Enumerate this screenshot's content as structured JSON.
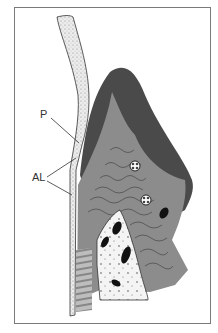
{
  "figure": {
    "labels": {
      "p": "P",
      "al": "AL"
    },
    "colors": {
      "frame_border": "#7a7a7a",
      "dark_tissue": "#4a4a4a",
      "mid_tissue": "#8c8c8c",
      "light_tissue": "#a8a8a8",
      "bone_fill": "#f2f2f2",
      "enamel_fill": "#ececec",
      "line": "#333333"
    }
  }
}
